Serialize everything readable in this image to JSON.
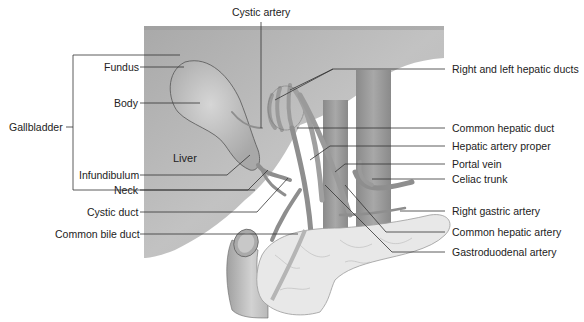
{
  "diagram": {
    "colors": {
      "background": "#ffffff",
      "liver": "#b3b3b3",
      "liver_light": "#d0d0d0",
      "gallbladder": "#c4c4c4",
      "vessel": "#8e8e8e",
      "vessel_light": "#b0b0b0",
      "pancreas": "#e6e6e6",
      "duodenum": "#c8c8c8",
      "leader_line": "#333333",
      "label_text": "#222222"
    },
    "labels": {
      "cystic_artery": "Cystic artery",
      "fundus": "Fundus",
      "body": "Body",
      "gallbladder": "Gallbladder",
      "liver": "Liver",
      "infundibulum": "Infundibulum",
      "neck": "Neck",
      "cystic_duct": "Cystic duct",
      "common_bile_duct": "Common bile duct",
      "right_left_hepatic_ducts": "Right and left hepatic ducts",
      "common_hepatic_duct": "Common hepatic duct",
      "hepatic_artery_proper": "Hepatic artery proper",
      "portal_vein": "Portal vein",
      "celiac_trunk": "Celiac trunk",
      "right_gastric_artery": "Right gastric artery",
      "common_hepatic_artery": "Common hepatic artery",
      "gastroduodenal_artery": "Gastroduodenal artery"
    }
  }
}
